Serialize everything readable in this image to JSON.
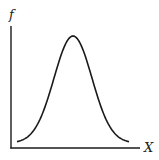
{
  "chart_data": {
    "type": "line",
    "title": "",
    "xlabel": "X",
    "ylabel": "f",
    "grid": false,
    "legend": null,
    "series": [
      {
        "name": "bell curve",
        "shape": "normal distribution",
        "peak_x_fraction": 0.5
      }
    ],
    "colors": {
      "line": "#1a1a1a",
      "axis": "#1a1a1a",
      "background": "#ffffff"
    }
  },
  "labels": {
    "x_axis": "X",
    "y_axis": "f"
  }
}
